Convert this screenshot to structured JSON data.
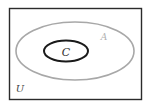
{
  "diagram": {
    "type": "venn",
    "universe": {
      "label": "U",
      "border_color": "#2b2b2b"
    },
    "sets": [
      {
        "name": "A",
        "label": "A",
        "stroke_color": "#a8a8a8",
        "contains": [
          "C"
        ]
      },
      {
        "name": "C",
        "label": "C",
        "stroke_color": "#1a1a1a",
        "subset_of": "A"
      }
    ],
    "relation": "C ⊂ A ⊂ U"
  }
}
